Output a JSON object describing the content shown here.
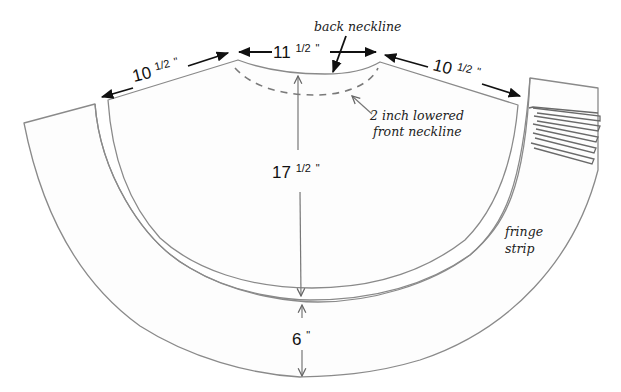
{
  "diagram": {
    "dimensions": {
      "left_shoulder": {
        "whole": "10",
        "fraction": "1/2",
        "unit": "\""
      },
      "neck_width": {
        "whole": "11",
        "fraction": "1/2",
        "unit": "\""
      },
      "right_shoulder": {
        "whole": "10",
        "fraction": "1/2",
        "unit": "\""
      },
      "body_length": {
        "whole": "17",
        "fraction": "1/2",
        "unit": "\""
      },
      "fringe_width": {
        "whole": "6",
        "fraction": "",
        "unit": "\""
      }
    },
    "annotations": {
      "back_neckline": "back neckline",
      "front_neckline_line1": "2 inch lowered",
      "front_neckline_line2": "front neckline",
      "fringe_line1": "fringe",
      "fringe_line2": "strip"
    },
    "colors": {
      "outline": "#8a8a8a",
      "dimension_arrow": "#111111",
      "background": "#ffffff"
    }
  }
}
